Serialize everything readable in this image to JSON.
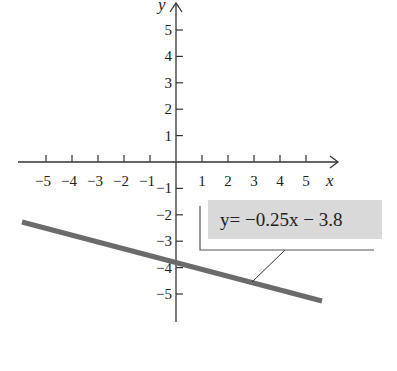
{
  "chart_data": {
    "type": "line",
    "title": "",
    "xlabel": "x",
    "ylabel": "y",
    "xlim": [
      -6,
      6
    ],
    "ylim": [
      -6,
      6
    ],
    "grid": false,
    "x_ticks": [
      "−5",
      "−4",
      "−3",
      "−2",
      "−1",
      "1",
      "2",
      "3",
      "4",
      "5"
    ],
    "y_ticks": [
      "5",
      "4",
      "3",
      "2",
      "1",
      "−1",
      "−2",
      "−3",
      "−4",
      "−5"
    ],
    "series": [
      {
        "name": "y = −0.25x − 3.8",
        "slope": -0.25,
        "intercept": -3.8,
        "x": [
          -5.8,
          5.6
        ],
        "y": [
          -2.35,
          -5.2
        ],
        "color": "#6b6b6b"
      }
    ],
    "annotation": {
      "text": "y= −0.25x − 3.8",
      "background": "#d9d9d9"
    }
  }
}
